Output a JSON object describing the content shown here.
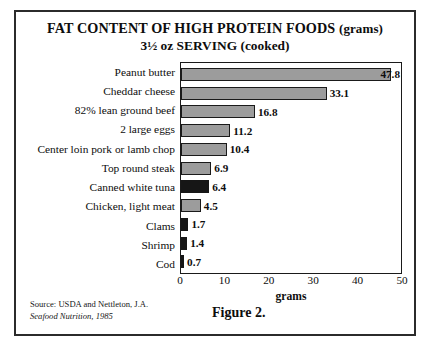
{
  "chart_data": {
    "type": "bar",
    "orientation": "horizontal",
    "title": "FAT CONTENT OF HIGH PROTEIN FOODS (grams)",
    "title_main": "FAT CONTENT OF HIGH PROTEIN FOODS",
    "title_paren": "(grams)",
    "subtitle": "3½ oz SERVING (cooked)",
    "xlabel": "grams",
    "ylabel": "",
    "xlim": [
      0,
      50
    ],
    "xticks": [
      0,
      10,
      20,
      30,
      40,
      50
    ],
    "xtick_labels": [
      "0",
      "10",
      "20",
      "30",
      "40",
      "50"
    ],
    "grid": false,
    "legend": false,
    "categories": [
      "Peanut butter",
      "Cheddar cheese",
      "82% lean ground beef",
      "2 large eggs",
      "Center loin pork or lamb chop",
      "Top round steak",
      "Canned white tuna",
      "Chicken, light meat",
      "Clams",
      "Shrimp",
      "Cod"
    ],
    "values": [
      47.8,
      33.1,
      16.8,
      11.2,
      10.4,
      6.9,
      6.4,
      4.5,
      1.7,
      1.4,
      0.7
    ],
    "value_labels": [
      "47.8",
      "33.1",
      "16.8",
      "11.2",
      "10.4",
      "6.9",
      "6.4",
      "4.5",
      "1.7",
      "1.4",
      "0.7"
    ],
    "bar_styles": [
      "gray",
      "gray",
      "gray",
      "gray",
      "gray",
      "gray",
      "dark",
      "gray",
      "dark",
      "dark",
      "dark"
    ],
    "label_inside": [
      true,
      false,
      false,
      false,
      false,
      false,
      false,
      false,
      false,
      false,
      false
    ],
    "colors": {
      "bar_gray": "#9c9c9c",
      "bar_dark": "#161616",
      "bar_border": "#1a1a1a",
      "axis": "#1a1a1a",
      "text": "#0d0d0d",
      "frame": "#2b2b2b",
      "background": "#ffffff"
    }
  },
  "footer": {
    "source_line1": "Source: USDA and Nettleton, J.A.",
    "source_line2": "Seafood Nutrition, 1985",
    "figure_caption": "Figure 2."
  }
}
